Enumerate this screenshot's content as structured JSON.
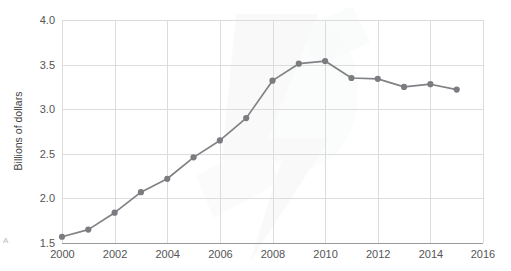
{
  "chart_data": {
    "type": "line",
    "title": "",
    "subtitle": "",
    "xlabel": "",
    "ylabel": "Billions of dollars",
    "x": [
      2000,
      2001,
      2002,
      2003,
      2004,
      2005,
      2006,
      2007,
      2008,
      2009,
      2010,
      2011,
      2012,
      2013,
      2014,
      2015
    ],
    "values": [
      1.57,
      1.65,
      1.84,
      2.07,
      2.22,
      2.46,
      2.65,
      2.9,
      3.32,
      3.51,
      3.54,
      3.35,
      3.34,
      3.25,
      3.28,
      3.22
    ],
    "series": [
      {
        "name": "Billions of dollars",
        "values": [
          1.57,
          1.65,
          1.84,
          2.07,
          2.22,
          2.46,
          2.65,
          2.9,
          3.32,
          3.51,
          3.54,
          3.35,
          3.34,
          3.25,
          3.28,
          3.22
        ]
      }
    ],
    "xlim": [
      2000,
      2016
    ],
    "ylim": [
      1.5,
      4.0
    ],
    "xticks": [
      2000,
      2002,
      2004,
      2006,
      2008,
      2010,
      2012,
      2014,
      2016
    ],
    "xtick_labels": [
      "2000",
      "2002",
      "2004",
      "2006",
      "2008",
      "2010",
      "2012",
      "2014",
      "2016"
    ],
    "yticks": [
      1.5,
      2.0,
      2.5,
      3.0,
      3.5,
      4.0
    ],
    "ytick_labels": [
      "1.5",
      "2.0",
      "2.5",
      "3.0",
      "3.5",
      "4.0"
    ],
    "grid": true,
    "grid_x": true,
    "grid_y": true,
    "legend": false,
    "legend_position": "none",
    "marker": "circle",
    "line_color": "#808285",
    "marker_color": "#7a7c7f",
    "grid_color": "#dcdcdc",
    "axis_color": "#9a9a9a",
    "background": "#ffffff",
    "watermark": true,
    "annotations": []
  },
  "corner": {
    "mark": "A"
  }
}
